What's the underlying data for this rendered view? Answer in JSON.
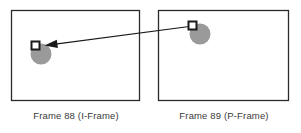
{
  "figure": {
    "background_color": "#ffffff",
    "frame_border_color": "#2b2b2b",
    "frame_fill_color": "#ffffff",
    "object_color": "#9a9a9a",
    "marker_fill_color": "#ffffff",
    "marker_border_color": "#1a1a1a",
    "arrow_color": "#1a1a1a",
    "caption_color": "#3a3a3a"
  },
  "frames": [
    {
      "id": "frame-left",
      "caption": "Frame 88 (I-Frame)",
      "frame_number": "88",
      "frame_type": "I-Frame",
      "box": {
        "x": 11,
        "y": 10,
        "width": 129,
        "height": 91
      },
      "object": {
        "name": "gray-circle",
        "cx": 41,
        "cy": 54,
        "r": 10.5
      },
      "marker": {
        "name": "macroblock-marker",
        "x": 31,
        "y": 41,
        "size": 9
      }
    },
    {
      "id": "frame-right",
      "caption": "Frame 89 (P-Frame)",
      "frame_number": "89",
      "frame_type": "P-Frame",
      "box": {
        "x": 158,
        "y": 10,
        "width": 131,
        "height": 91
      },
      "object": {
        "name": "gray-circle",
        "cx": 200,
        "cy": 34,
        "r": 10.5
      },
      "marker": {
        "name": "macroblock-marker",
        "x": 188,
        "y": 21,
        "size": 9
      }
    }
  ],
  "motion_vector": {
    "name": "motion-vector-arrow",
    "from_x": 193,
    "from_y": 26,
    "to_x": 41,
    "to_y": 46,
    "direction": "right-to-left",
    "arrowhead_at": "left"
  }
}
